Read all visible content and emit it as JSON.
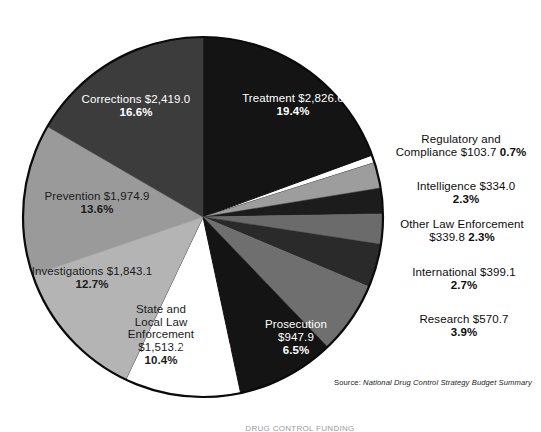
{
  "figure": {
    "source_label": "Source:",
    "source_title": "National Drug Control Strategy Budget Summary",
    "bottom_caption": "DRUG CONTROL FUNDING"
  },
  "chart_data": {
    "type": "pie",
    "title": "",
    "units": "millions of dollars",
    "center": {
      "x": 203,
      "y": 217
    },
    "radius": 180,
    "start_angle_deg": 0,
    "direction": "clockwise",
    "legend": "none (direct labels)",
    "categories": [
      "Treatment",
      "Regulatory and Compliance",
      "Intelligence",
      "Other Law Enforcement",
      "International",
      "Research",
      "Prosecution",
      "Interdiction",
      "State and Local Law Enforcement",
      "Investigations",
      "Prevention",
      "Corrections"
    ],
    "values": [
      2826.6,
      103.7,
      334.0,
      339.8,
      399.1,
      570.7,
      947.9,
      1278.4,
      1513.2,
      1843.1,
      1974.9,
      2419.0
    ],
    "percents": [
      19.4,
      0.7,
      2.3,
      2.3,
      2.7,
      3.9,
      6.5,
      8.8,
      10.4,
      12.7,
      13.6,
      16.6
    ],
    "colors": [
      "#141414",
      "#ffffff",
      "#9d9d9d",
      "#1c1c1c",
      "#6b6b6b",
      "#2a2a2a",
      "#6f6f6f",
      "#141414",
      "#ffffff",
      "#b4b4b4",
      "#9a9a9a",
      "#3c3c3c"
    ],
    "slices": [
      {
        "name": "Treatment",
        "value_text": "Treatment $2,826.6",
        "pct_text": "19.4%",
        "value": 2826.6,
        "percent": 19.4,
        "color": "#141414",
        "label_color": "white",
        "label_position": "inside"
      },
      {
        "name": "Regulatory and Compliance",
        "value_text": "Regulatory and Compliance $103.7",
        "pct_text": "0.7%",
        "line1": "Regulatory and",
        "line2": "Compliance $103.7",
        "value": 103.7,
        "percent": 0.7,
        "color": "#ffffff",
        "label_color": "black",
        "label_position": "outside"
      },
      {
        "name": "Intelligence",
        "value_text": "Intelligence $334.0",
        "pct_text": "2.3%",
        "value": 334.0,
        "percent": 2.3,
        "color": "#9d9d9d",
        "label_color": "black",
        "label_position": "outside"
      },
      {
        "name": "Other Law Enforcement",
        "value_text": "Other Law Enforcement",
        "pct_text": "2.3%",
        "line1": "Other Law Enforcement",
        "line2": "$339.8",
        "value": 339.8,
        "percent": 2.3,
        "color": "#1c1c1c",
        "label_color": "black",
        "label_position": "outside"
      },
      {
        "name": "International",
        "value_text": "International $399.1",
        "pct_text": "2.7%",
        "value": 399.1,
        "percent": 2.7,
        "color": "#6b6b6b",
        "label_color": "black",
        "label_position": "outside"
      },
      {
        "name": "Research",
        "value_text": "Research $570.7",
        "pct_text": "3.9%",
        "value": 570.7,
        "percent": 3.9,
        "color": "#2a2a2a",
        "label_color": "black",
        "label_position": "outside"
      },
      {
        "name": "Prosecution",
        "value_text": "Prosecution",
        "pct_text": "6.5%",
        "line1": "Prosecution",
        "line2": "$947.9",
        "value": 947.9,
        "percent": 6.5,
        "color": "#6f6f6f",
        "label_color": "white",
        "label_position": "inside"
      },
      {
        "name": "Interdiction",
        "value_text": "Interdiction",
        "pct_text": "8.8%",
        "line1": "Interdiction",
        "line2": "$1,278.4",
        "value": 1278.4,
        "percent": 8.8,
        "color": "#141414",
        "label_color": "white",
        "label_position": "inside"
      },
      {
        "name": "State and Local Law Enforcement",
        "value_text": "State and Local Law Enforcement $1,513.2",
        "pct_text": "10.4%",
        "line1": "State and",
        "line2": "Local Law",
        "line3": "Enforcement",
        "line4": "$1,513.2",
        "value": 1513.2,
        "percent": 10.4,
        "color": "#ffffff",
        "label_color": "black",
        "label_position": "inside"
      },
      {
        "name": "Investigations",
        "value_text": "Investigations $1,843.1",
        "pct_text": "12.7%",
        "value": 1843.1,
        "percent": 12.7,
        "color": "#b4b4b4",
        "label_color": "black",
        "label_position": "inside"
      },
      {
        "name": "Prevention",
        "value_text": "Prevention $1,974.9",
        "pct_text": "13.6%",
        "value": 1974.9,
        "percent": 13.6,
        "color": "#9a9a9a",
        "label_color": "black",
        "label_position": "inside"
      },
      {
        "name": "Corrections",
        "value_text": "Corrections $2,419.0",
        "pct_text": "16.6%",
        "value": 2419.0,
        "percent": 16.6,
        "color": "#3c3c3c",
        "label_color": "white",
        "label_position": "inside"
      }
    ]
  },
  "labels": {
    "treatment": {
      "line1": "Treatment $2,826.6",
      "pct": "19.4%"
    },
    "corrections": {
      "line1": "Corrections $2,419.0",
      "pct": "16.6%"
    },
    "prevention": {
      "line1": "Prevention $1,974.9",
      "pct": "13.6%"
    },
    "investigations": {
      "line1": "Investigations $1,843.1",
      "pct": "12.7%"
    },
    "state_local": {
      "line1": "State and",
      "line2": "Local Law",
      "line3": "Enforcement",
      "line4": "$1,513.2",
      "pct": "10.4%"
    },
    "interdiction": {
      "line1": "Interdiction",
      "line2": "$1,278.4",
      "pct": "8.8%"
    },
    "prosecution": {
      "line1": "Prosecution",
      "line2": "$947.9",
      "pct": "6.5%"
    },
    "regulatory": {
      "line1": "Regulatory and",
      "line2": "Compliance $103.7",
      "pct": "0.7%"
    },
    "intelligence": {
      "line1": "Intelligence $334.0",
      "pct": "2.3%"
    },
    "other_law": {
      "line1": "Other Law Enforcement",
      "line2": "$339.8",
      "pct": "2.3%"
    },
    "international": {
      "line1": "International $399.1",
      "pct": "2.7%"
    },
    "research": {
      "line1": "Research $570.7",
      "pct": "3.9%"
    }
  }
}
